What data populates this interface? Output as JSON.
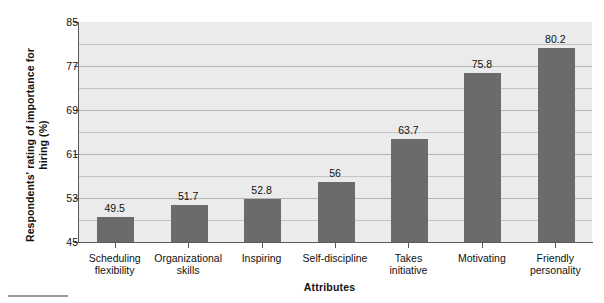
{
  "chart_data": {
    "type": "bar",
    "title": "",
    "xlabel": "Attributes",
    "ylabel": "Respondents' rating of importance for hiring (%)",
    "categories": [
      "Scheduling flexibility",
      "Organizational skills",
      "Inspiring",
      "Self-discipline",
      "Takes initiative",
      "Motivating",
      "Friendly personality"
    ],
    "category_lines": [
      [
        "Scheduling",
        "flexibility"
      ],
      [
        "Organizational",
        "skills"
      ],
      [
        "Inspiring",
        ""
      ],
      [
        "Self-discipline",
        ""
      ],
      [
        "Takes",
        "initiative"
      ],
      [
        "Motivating",
        ""
      ],
      [
        "Friendly",
        "personality"
      ]
    ],
    "values": [
      49.5,
      51.7,
      52.8,
      56,
      63.7,
      75.8,
      80.2
    ],
    "value_labels": [
      "49.5",
      "51.7",
      "52.8",
      "56",
      "63.7",
      "75.8",
      "80.2"
    ],
    "ylim": [
      45,
      85
    ],
    "ytick_labels": [
      "85",
      "77",
      "69",
      "61",
      "53",
      "45"
    ],
    "yticks": [
      85,
      77,
      69,
      61,
      53,
      45
    ],
    "grid": true,
    "gridline_interval": 4,
    "legend": "none",
    "colors": {
      "bar_fill": "#6b6b6b",
      "plot_background": "#ebebeb",
      "gridline": "#c4c4c4",
      "axis_line": "#58585a",
      "text": "#111111"
    }
  }
}
